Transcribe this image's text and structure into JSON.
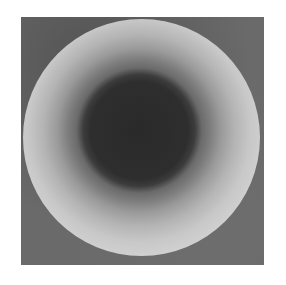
{
  "image": {
    "description": "Grayscale disk with concentric rings (dark center, light outer ring) on dark gray square",
    "colors": {
      "background": "#ffffff",
      "square": "#6a6a6a",
      "center": "#2a2a2a",
      "outer_ring": "#d6d6d6"
    }
  }
}
